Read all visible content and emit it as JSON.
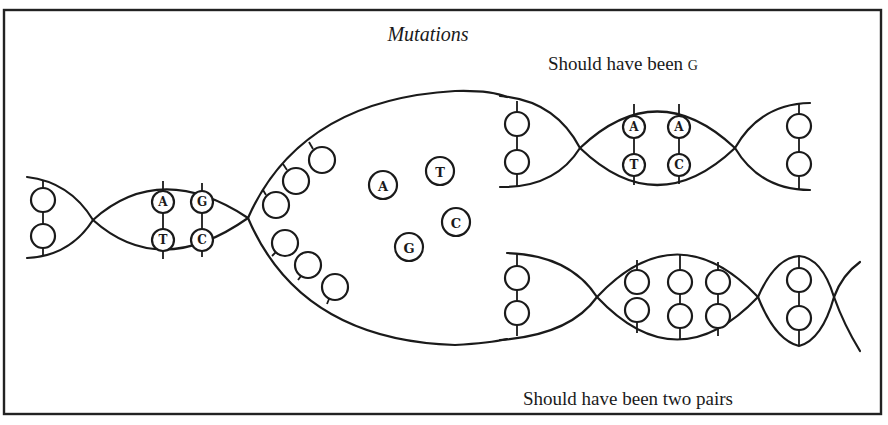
{
  "figure": {
    "title": "Mutations",
    "captions": {
      "upper": {
        "text": "Should have been",
        "smallcap": "G"
      },
      "lower": {
        "text": "Should have been two pairs"
      }
    },
    "left_helix": {
      "pairs": [
        {
          "top": "A",
          "bottom": "T"
        },
        {
          "top": "G",
          "bottom": "C"
        }
      ]
    },
    "free_nucleotides": [
      "A",
      "T",
      "C",
      "G"
    ],
    "upper_daughter": {
      "pairs": [
        {
          "top": "A",
          "bottom": "T"
        },
        {
          "top": "A",
          "bottom": "C"
        }
      ],
      "note": "mismatch: A paired with C"
    },
    "lower_daughter": {
      "note": "pair count error"
    },
    "colors": {
      "ink": "#1a1a1a",
      "paper": "#ffffff"
    }
  }
}
